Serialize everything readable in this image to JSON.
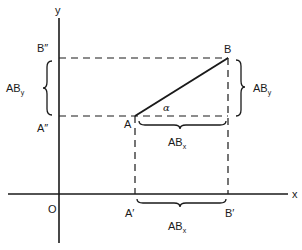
{
  "diagram": {
    "axes": {
      "x_label": "x",
      "y_label": "y",
      "origin_label": "O"
    },
    "points": {
      "A": "A",
      "B": "B",
      "A_prime": "A′",
      "B_prime": "B′",
      "A_double_prime": "A″",
      "B_double_prime": "B″"
    },
    "angle_label": "α",
    "components": {
      "x_main": "AB",
      "x_sub": "x",
      "y_main": "AB",
      "y_sub": "y"
    },
    "colors": {
      "stroke": "#1a1a1a",
      "background": "#ffffff"
    }
  }
}
